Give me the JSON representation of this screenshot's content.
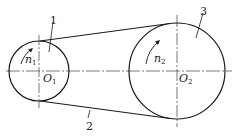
{
  "diagram": {
    "type": "belt-drive",
    "colors": {
      "stroke": "#1a1a1a",
      "centerline": "#555555",
      "background": "#ffffff"
    },
    "pulleys": [
      {
        "id": "small-pulley",
        "part_label": "1",
        "center_label": "O",
        "center_sub": "1",
        "speed_label": "n",
        "speed_sub": "1",
        "cx": 39,
        "cy": 71,
        "r": 30
      },
      {
        "id": "large-pulley",
        "part_label": "3",
        "center_label": "O",
        "center_sub": "2",
        "speed_label": "n",
        "speed_sub": "2",
        "cx": 177,
        "cy": 71,
        "r": 48
      }
    ],
    "belt": {
      "part_label": "2"
    }
  }
}
